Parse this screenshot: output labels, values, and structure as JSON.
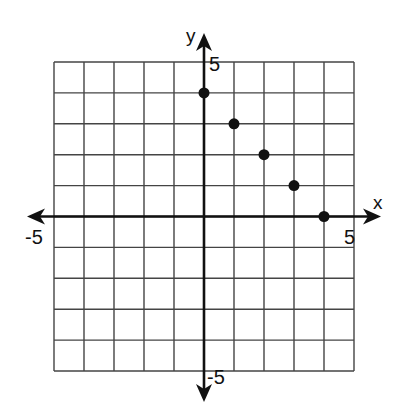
{
  "chart_data": {
    "type": "scatter",
    "title": "",
    "xlabel": "x",
    "ylabel": "y",
    "xlim": [
      -5,
      5
    ],
    "ylim": [
      -5,
      5
    ],
    "grid": true,
    "grid_step": 1,
    "tick_labels": {
      "x": [
        {
          "value": -5,
          "label": "-5"
        },
        {
          "value": 5,
          "label": "5"
        }
      ],
      "y": [
        {
          "value": 5,
          "label": "5"
        },
        {
          "value": -5,
          "label": "-5"
        }
      ]
    },
    "series": [
      {
        "name": "points",
        "points": [
          {
            "x": 0,
            "y": 4
          },
          {
            "x": 1,
            "y": 3
          },
          {
            "x": 2,
            "y": 2
          },
          {
            "x": 3,
            "y": 1
          },
          {
            "x": 4,
            "y": 0
          }
        ]
      }
    ],
    "legend": null
  },
  "colors": {
    "grid": "#444444",
    "axis": "#111111",
    "point": "#111111",
    "background": "#ffffff"
  }
}
